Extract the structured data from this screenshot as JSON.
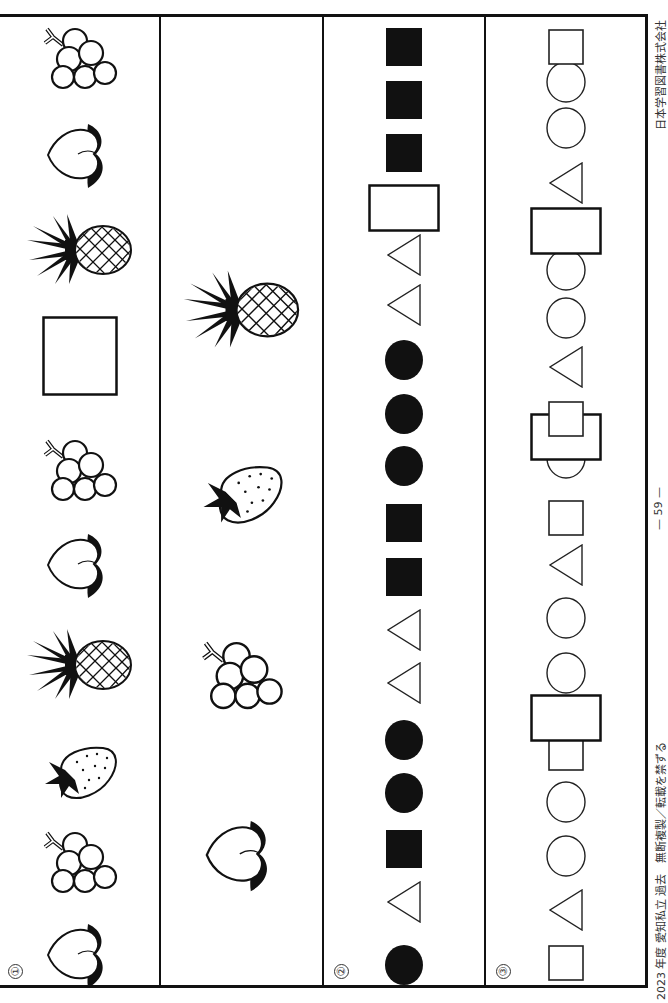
{
  "worksheet": {
    "footer_left": "2023 年度 愛知私立 過去　無断複製／転載を禁ずる",
    "page_number": "— 59 —",
    "publisher": "日本学習図書株式会社",
    "sections": [
      {
        "label": "①",
        "type": "fruit-pattern",
        "items_bottom_to_top": [
          "peach",
          "grape",
          "strawberry",
          "pineapple",
          "peach",
          "grape",
          "blank",
          "pineapple",
          "peach",
          "grape"
        ]
      },
      {
        "label": "",
        "type": "answer-choices",
        "items_bottom_to_top": [
          "peach",
          "grape",
          "strawberry",
          "pineapple"
        ]
      },
      {
        "label": "②",
        "type": "shape-pattern",
        "items_bottom_to_top": [
          "filled-circle",
          "triangle",
          "filled-square",
          "filled-circle",
          "filled-circle",
          "triangle",
          "triangle",
          "filled-square",
          "filled-square",
          "filled-circle",
          "filled-circle",
          "filled-circle",
          "triangle",
          "triangle",
          "blank",
          "filled-square",
          "filled-square",
          "filled-square"
        ]
      },
      {
        "label": "③",
        "type": "shape-pattern",
        "items_bottom_to_top": [
          "square",
          "triangle",
          "circle",
          "circle",
          "square",
          "blank",
          "circle",
          "circle",
          "triangle",
          "square",
          "circle",
          "blank",
          "square",
          "triangle",
          "circle",
          "circle",
          "blank",
          "triangle",
          "circle",
          "circle",
          "square"
        ]
      }
    ]
  }
}
